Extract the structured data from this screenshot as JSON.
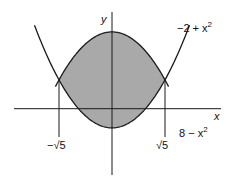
{
  "figure": {
    "axis_labels": {
      "x": "x",
      "y": "y"
    },
    "curve_labels": {
      "upper_parabola": "8 − x",
      "lower_parabola": "−2 + x",
      "exponent": "2"
    },
    "tick_labels": {
      "left": "−√5",
      "right": "√5"
    },
    "colors": {
      "shade": "#a9a9a9",
      "stroke": "#1a1a1a"
    }
  },
  "chart_data": {
    "type": "line",
    "title": "",
    "xlabel": "x",
    "ylabel": "y",
    "series": [
      {
        "name": "8 − x^2",
        "expr": "8 - x^2"
      },
      {
        "name": "−2 + x^2",
        "expr": "-2 + x^2"
      }
    ],
    "shaded_region": "between curves for −√5 ≤ x ≤ √5",
    "intersections": [
      [
        -2.236,
        3
      ],
      [
        2.236,
        3
      ]
    ],
    "tick_labels": [
      "−√5",
      "√5"
    ],
    "grid": false
  }
}
